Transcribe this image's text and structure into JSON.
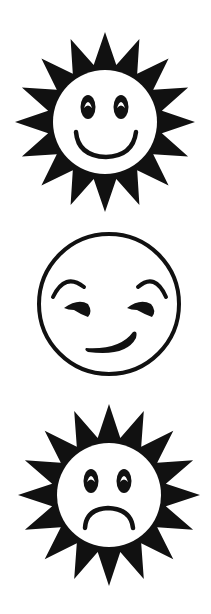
{
  "canvas": {
    "width": 211,
    "height": 614,
    "background": "#ffffff",
    "ink": "#111111"
  },
  "figures": [
    {
      "id": "happy-sun",
      "label": "Happy sun face",
      "type": "sun",
      "expression": "smile",
      "center": [
        105,
        122
      ],
      "ray_count": 16,
      "ray_outer": 90,
      "ray_inner": 58,
      "face_radius": 52
    },
    {
      "id": "smirk-face",
      "label": "Smirking face",
      "type": "plain-circle",
      "expression": "smirk",
      "center": [
        109,
        304
      ],
      "face_radius": 70
    },
    {
      "id": "sad-sun",
      "label": "Sad sun face",
      "type": "sun",
      "expression": "frown",
      "center": [
        109,
        495
      ],
      "ray_count": 16,
      "ray_outer": 91,
      "ray_inner": 58,
      "face_radius": 52
    }
  ]
}
